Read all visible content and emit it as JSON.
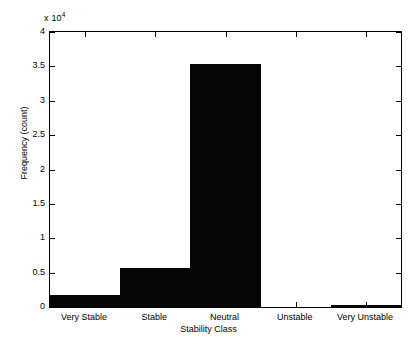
{
  "chart_data": {
    "type": "bar",
    "title": "",
    "xlabel": "Stability Class",
    "ylabel": "Frequency (count)",
    "categories": [
      "Very Stable",
      "Stable",
      "Neutral",
      "Unstable",
      "Very Unstable"
    ],
    "values": [
      1700,
      5700,
      35300,
      0,
      300
    ],
    "ylim": [
      0,
      40000
    ],
    "xlim": [
      0,
      5
    ],
    "y_exponent_label": "x 10",
    "y_exponent_power": "4",
    "y_tick_values": [
      0,
      5000,
      10000,
      15000,
      20000,
      25000,
      30000,
      35000,
      40000
    ],
    "y_tick_labels": [
      "0",
      "0.5",
      "1",
      "1.5",
      "2",
      "2.5",
      "3",
      "3.5",
      "4"
    ],
    "grid": false,
    "legend": null,
    "bar_color": "#050505",
    "axis_color": "#000000",
    "background_color": "#ffffff",
    "bar_relative_width": 1.0,
    "box_on": true,
    "tick_direction": "in"
  }
}
